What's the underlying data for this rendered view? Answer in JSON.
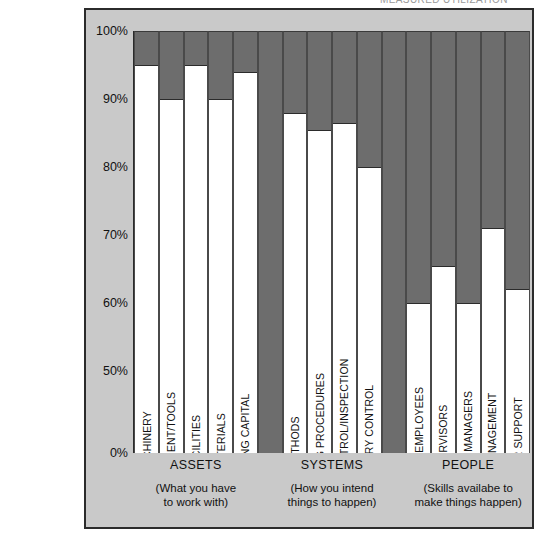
{
  "top_caption_fragment": "MEASURED  UTILIZATION",
  "chart_data": {
    "type": "bar",
    "title": "",
    "xlabel": "",
    "ylabel": "",
    "ylim": [
      0,
      100
    ],
    "axis_broken": true,
    "grid": false,
    "legend": "none",
    "ytick_labels": [
      "100%",
      "90%",
      "80%",
      "70%",
      "60%",
      "50%",
      "0%"
    ],
    "ytick_values": [
      100,
      90,
      80,
      70,
      60,
      50,
      0
    ],
    "bar_fill_color": "#ffffff",
    "bar_remainder_color": "#6d6d6d",
    "background_color": "#c9c9c9",
    "categories": [
      "MACHINERY",
      "EQUIPMENT/TOOLS",
      "FACILITIES",
      "MATERIALS",
      "WORKING CAPITAL",
      "METHODS",
      "OPERATING PROCEDURES",
      "QUALITY CONTROL/INSPECTION",
      "INVENTORY CONTROL",
      "HOURLY EMPLOYEES",
      "SUPERVISORS",
      "MIDDLE MANAGERS",
      "TOP MANAGEMENT",
      "OTHER SUPPORT"
    ],
    "values": [
      95,
      90,
      95,
      90,
      94,
      88,
      85.5,
      86.5,
      80,
      60,
      65.5,
      60,
      71,
      62
    ],
    "groups": [
      {
        "name": "ASSETS",
        "description_line1": "(What you have",
        "description_line2": "to work with)",
        "categories": [
          "MACHINERY",
          "EQUIPMENT/TOOLS",
          "FACILITIES",
          "MATERIALS",
          "WORKING CAPITAL"
        ],
        "values": [
          95,
          90,
          95,
          90,
          94
        ]
      },
      {
        "name": "SYSTEMS",
        "description_line1": "(How you intend",
        "description_line2": "things to happen)",
        "categories": [
          "METHODS",
          "OPERATING PROCEDURES",
          "QUALITY CONTROL/INSPECTION",
          "INVENTORY CONTROL"
        ],
        "values": [
          88,
          85.5,
          86.5,
          80
        ]
      },
      {
        "name": "PEOPLE",
        "description_line1": "(Skills availabe to",
        "description_line2": "make things happen)",
        "categories": [
          "HOURLY EMPLOYEES",
          "SUPERVISORS",
          "MIDDLE MANAGERS",
          "TOP MANAGEMENT",
          "OTHER SUPPORT"
        ],
        "values": [
          60,
          65.5,
          60,
          71,
          62
        ]
      }
    ]
  }
}
